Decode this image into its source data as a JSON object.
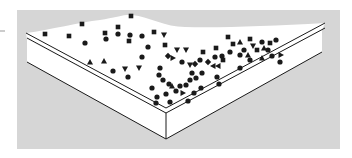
{
  "figure": {
    "colors": {
      "background_panel": "#d6d6d6",
      "surface": "#ffffff",
      "edge_line": "#1a1a1a",
      "particle": "#1a1a1a"
    },
    "particles": [
      {
        "shape": "square",
        "x": 45,
        "y": 34
      },
      {
        "shape": "square",
        "x": 69,
        "y": 36
      },
      {
        "shape": "square",
        "x": 82,
        "y": 24
      },
      {
        "shape": "circle",
        "x": 85,
        "y": 43
      },
      {
        "shape": "square",
        "x": 105,
        "y": 33
      },
      {
        "shape": "circle",
        "x": 106,
        "y": 39
      },
      {
        "shape": "square",
        "x": 118,
        "y": 27
      },
      {
        "shape": "circle",
        "x": 118,
        "y": 34
      },
      {
        "shape": "circle",
        "x": 130,
        "y": 35
      },
      {
        "shape": "square",
        "x": 129,
        "y": 41
      },
      {
        "shape": "square",
        "x": 131,
        "y": 16
      },
      {
        "shape": "circle",
        "x": 142,
        "y": 36
      },
      {
        "shape": "square",
        "x": 154,
        "y": 32
      },
      {
        "shape": "triangle-down",
        "x": 164,
        "y": 35
      },
      {
        "shape": "circle",
        "x": 148,
        "y": 47
      },
      {
        "shape": "square",
        "x": 165,
        "y": 45
      },
      {
        "shape": "triangle-up",
        "x": 90,
        "y": 62
      },
      {
        "shape": "triangle-up",
        "x": 104,
        "y": 61
      },
      {
        "shape": "circle",
        "x": 113,
        "y": 71
      },
      {
        "shape": "triangle-down",
        "x": 125,
        "y": 69
      },
      {
        "shape": "triangle-down",
        "x": 139,
        "y": 68
      },
      {
        "shape": "circle",
        "x": 128,
        "y": 77
      },
      {
        "shape": "circle",
        "x": 142,
        "y": 57
      },
      {
        "shape": "diamond",
        "x": 168,
        "y": 56
      },
      {
        "shape": "triangle-right",
        "x": 173,
        "y": 58
      },
      {
        "shape": "circle",
        "x": 160,
        "y": 68
      },
      {
        "shape": "circle",
        "x": 159,
        "y": 75
      },
      {
        "shape": "circle",
        "x": 163,
        "y": 80
      },
      {
        "shape": "triangle-down",
        "x": 177,
        "y": 50
      },
      {
        "shape": "triangle-down",
        "x": 186,
        "y": 50
      },
      {
        "shape": "circle",
        "x": 182,
        "y": 62
      },
      {
        "shape": "triangle-down",
        "x": 190,
        "y": 65
      },
      {
        "shape": "circle",
        "x": 200,
        "y": 60
      },
      {
        "shape": "circle",
        "x": 192,
        "y": 73
      },
      {
        "shape": "diamond",
        "x": 195,
        "y": 64
      },
      {
        "shape": "square",
        "x": 203,
        "y": 52
      },
      {
        "shape": "circle",
        "x": 215,
        "y": 57
      },
      {
        "shape": "diamond",
        "x": 208,
        "y": 62
      },
      {
        "shape": "triangle-left",
        "x": 213,
        "y": 66
      },
      {
        "shape": "triangle-left",
        "x": 218,
        "y": 66
      },
      {
        "shape": "circle",
        "x": 190,
        "y": 80
      },
      {
        "shape": "circle",
        "x": 202,
        "y": 73
      },
      {
        "shape": "square",
        "x": 216,
        "y": 48
      },
      {
        "shape": "circle",
        "x": 222,
        "y": 56
      },
      {
        "shape": "circle",
        "x": 217,
        "y": 77
      },
      {
        "shape": "square",
        "x": 228,
        "y": 37
      },
      {
        "shape": "square",
        "x": 233,
        "y": 44
      },
      {
        "shape": "triangle-up",
        "x": 240,
        "y": 42
      },
      {
        "shape": "square",
        "x": 250,
        "y": 39
      },
      {
        "shape": "triangle-down",
        "x": 253,
        "y": 46
      },
      {
        "shape": "circle",
        "x": 244,
        "y": 50
      },
      {
        "shape": "square",
        "x": 257,
        "y": 50
      },
      {
        "shape": "triangle-up",
        "x": 264,
        "y": 48
      },
      {
        "shape": "circle",
        "x": 262,
        "y": 42
      },
      {
        "shape": "circle",
        "x": 240,
        "y": 55
      },
      {
        "shape": "circle",
        "x": 230,
        "y": 52
      },
      {
        "shape": "triangle-up",
        "x": 248,
        "y": 55
      },
      {
        "shape": "circle",
        "x": 268,
        "y": 50
      },
      {
        "shape": "square",
        "x": 270,
        "y": 43
      },
      {
        "shape": "circle",
        "x": 276,
        "y": 40
      },
      {
        "shape": "triangle-up",
        "x": 262,
        "y": 58
      },
      {
        "shape": "circle",
        "x": 272,
        "y": 56
      },
      {
        "shape": "triangle-right",
        "x": 281,
        "y": 55
      },
      {
        "shape": "circle",
        "x": 250,
        "y": 60
      },
      {
        "shape": "circle",
        "x": 280,
        "y": 62
      },
      {
        "shape": "circle",
        "x": 240,
        "y": 68
      },
      {
        "shape": "square",
        "x": 223,
        "y": 60
      },
      {
        "shape": "circle",
        "x": 219,
        "y": 84
      },
      {
        "shape": "circle",
        "x": 152,
        "y": 88
      },
      {
        "shape": "circle",
        "x": 157,
        "y": 97
      },
      {
        "shape": "circle",
        "x": 156,
        "y": 103
      },
      {
        "shape": "circle",
        "x": 166,
        "y": 94
      },
      {
        "shape": "triangle-up",
        "x": 172,
        "y": 86
      },
      {
        "shape": "circle",
        "x": 169,
        "y": 84
      },
      {
        "shape": "circle",
        "x": 176,
        "y": 91
      },
      {
        "shape": "triangle-right",
        "x": 183,
        "y": 93
      },
      {
        "shape": "circle",
        "x": 180,
        "y": 86
      },
      {
        "shape": "circle",
        "x": 186,
        "y": 85
      },
      {
        "shape": "circle",
        "x": 194,
        "y": 93
      },
      {
        "shape": "circle",
        "x": 188,
        "y": 101
      },
      {
        "shape": "circle",
        "x": 170,
        "y": 102
      },
      {
        "shape": "circle",
        "x": 196,
        "y": 78
      },
      {
        "shape": "circle",
        "x": 201,
        "y": 88
      }
    ]
  }
}
